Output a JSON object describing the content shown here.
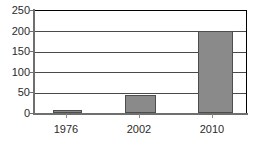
{
  "chart_data": {
    "type": "bar",
    "title": "",
    "subtitle": "",
    "xlabel": "",
    "ylabel": "",
    "categories": [
      "1976",
      "2002",
      "2010"
    ],
    "values": [
      7,
      45,
      200
    ],
    "series": [
      {
        "name": "",
        "values": [
          7,
          45,
          200
        ]
      }
    ],
    "ylim": [
      0,
      250
    ],
    "y_ticks": [
      "0",
      "50",
      "100",
      "150",
      "200",
      "250"
    ],
    "y_tick_values": [
      0,
      50,
      100,
      150,
      200,
      250
    ],
    "x_ticks": [
      "1976",
      "2002",
      "2010"
    ],
    "grid": "horizontal",
    "legend": "none",
    "colors": {
      "bar_fill": "#8a8a8a",
      "bar_border": "#4d4d4d",
      "gridline": "#4a4a4a",
      "axis": "#6f6f6f",
      "frame": "#000000",
      "text": "#2b2b2b",
      "background": "#ffffff"
    }
  }
}
